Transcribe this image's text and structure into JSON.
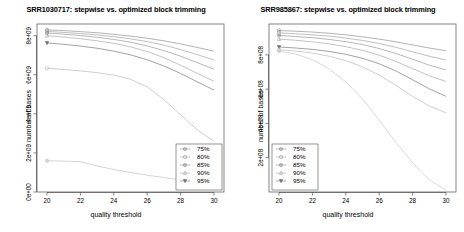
{
  "figure": {
    "width": 464,
    "height": 232,
    "background": "#ffffff",
    "panel_count": 2
  },
  "chart_data": [
    {
      "type": "line",
      "panel_index": 0,
      "title": "SRR1030717: stepwise vs. optimized block trimming",
      "xlabel": "quality threshold",
      "ylabel": "number of bases",
      "xlim": [
        19.4,
        30.6
      ],
      "ylim": [
        0,
        8600000000.0
      ],
      "xticks": [
        20,
        22,
        24,
        26,
        28,
        30
      ],
      "xticklabels": [
        "20",
        "22",
        "24",
        "26",
        "28",
        "30"
      ],
      "yticks": [
        0,
        2000000000,
        4000000000,
        6000000000,
        8000000000
      ],
      "yticklabels": [
        "0e+00",
        "2e+09",
        "4e+09",
        "6e+09",
        "8e+09"
      ],
      "grid": false,
      "legend_position": "bottom-right",
      "legend_entries": [
        "75%",
        "80%",
        "85%",
        "90%",
        "95%"
      ],
      "x": [
        20,
        21,
        22,
        23,
        24,
        25,
        26,
        27,
        28,
        29,
        30
      ],
      "series": [
        {
          "name": "75%",
          "marker": "circle-dot",
          "color": "#8a8a8a",
          "values": [
            8300000000.0,
            8260000000.0,
            8210000000.0,
            8150000000.0,
            8070000000.0,
            7980000000.0,
            7870000000.0,
            7740000000.0,
            7580000000.0,
            7400000000.0,
            7210000000.0
          ]
        },
        {
          "name": "80%",
          "marker": "circle-open",
          "color": "#9c9c9c",
          "values": [
            8220000000.0,
            8170000000.0,
            8110000000.0,
            8040000000.0,
            7950000000.0,
            7840000000.0,
            7700000000.0,
            7520000000.0,
            7290000000.0,
            7030000000.0,
            6760000000.0
          ]
        },
        {
          "name": "85%",
          "marker": "plus-circle",
          "color": "#8f8f8f",
          "values": [
            8140000000.0,
            8080000000.0,
            8010000000.0,
            7920000000.0,
            7810000000.0,
            7670000000.0,
            7480000000.0,
            7240000000.0,
            6950000000.0,
            6620000000.0,
            6290000000.0
          ]
        },
        {
          "name": "90%",
          "marker": "triangle-up",
          "color": "#a2a2a2",
          "values": [
            8000000000.0,
            7930000000.0,
            7850000000.0,
            7740000000.0,
            7610000000.0,
            7430000000.0,
            7190000000.0,
            6880000000.0,
            6490000000.0,
            6070000000.0,
            5670000000.0
          ]
        },
        {
          "name": "95%",
          "marker": "triangle-down",
          "color": "#707070",
          "values": [
            7630000000.0,
            7560000000.0,
            7470000000.0,
            7360000000.0,
            7210000000.0,
            7020000000.0,
            6770000000.0,
            6450000000.0,
            6070000000.0,
            5640000000.0,
            5220000000.0
          ]
        },
        {
          "name": "optimized-upper",
          "marker": "circle-open",
          "color": "#b5b5b5",
          "values": [
            6330000000.0,
            6270000000.0,
            6200000000.0,
            6110000000.0,
            5980000000.0,
            5770000000.0,
            5380000000.0,
            4730000000.0,
            3950000000.0,
            3180000000.0,
            2600000000.0
          ]
        },
        {
          "name": "optimized-lower",
          "marker": "plus-circle",
          "color": "#bcbcbc",
          "values": [
            1600000000.0,
            1580000000.0,
            1550000000.0,
            1330000000.0,
            1150000000.0,
            1000000000.0,
            860000000.0,
            740000000.0,
            620000000.0,
            520000000.0,
            440000000.0
          ]
        }
      ]
    },
    {
      "type": "line",
      "panel_index": 1,
      "title": "SRR985867: stepwise vs. optimized block trimming",
      "xlabel": "quality threshold",
      "ylabel": "number of bases",
      "xlim": [
        19.4,
        30.6
      ],
      "ylim": [
        0,
        980000000.0
      ],
      "xticks": [
        20,
        22,
        24,
        26,
        28,
        30
      ],
      "xticklabels": [
        "20",
        "22",
        "24",
        "26",
        "28",
        "30"
      ],
      "yticks": [
        200000000,
        400000000,
        600000000,
        800000000
      ],
      "yticklabels": [
        "2e+08",
        "4e+08",
        "6e+08",
        "8e+08"
      ],
      "grid": false,
      "legend_position": "bottom-left",
      "legend_entries": [
        "75%",
        "80%",
        "85%",
        "90%",
        "95%"
      ],
      "x": [
        20,
        21,
        22,
        23,
        24,
        25,
        26,
        27,
        28,
        29,
        30
      ],
      "series": [
        {
          "name": "75%",
          "marker": "circle-dot",
          "color": "#8a8a8a",
          "values": [
            942000000.0,
            938000000.0,
            933000000.0,
            926000000.0,
            917000000.0,
            905000000.0,
            892000000.0,
            876000000.0,
            858000000.0,
            840000000.0,
            824000000.0
          ]
        },
        {
          "name": "80%",
          "marker": "circle-open",
          "color": "#9c9c9c",
          "values": [
            928000000.0,
            923000000.0,
            917000000.0,
            909000000.0,
            898000000.0,
            884000000.0,
            866000000.0,
            844000000.0,
            818000000.0,
            792000000.0,
            770000000.0
          ]
        },
        {
          "name": "85%",
          "marker": "plus-circle",
          "color": "#8f8f8f",
          "values": [
            913000000.0,
            907000000.0,
            900000000.0,
            890000000.0,
            877000000.0,
            860000000.0,
            837000000.0,
            808000000.0,
            774000000.0,
            740000000.0,
            712000000.0
          ]
        },
        {
          "name": "90%",
          "marker": "triangle-up",
          "color": "#a2a2a2",
          "values": [
            892000000.0,
            885000000.0,
            876000000.0,
            864000000.0,
            848000000.0,
            826000000.0,
            798000000.0,
            762000000.0,
            720000000.0,
            678000000.0,
            645000000.0
          ]
        },
        {
          "name": "95%",
          "marker": "triangle-down",
          "color": "#707070",
          "values": [
            846000000.0,
            840000000.0,
            832000000.0,
            820000000.0,
            803000000.0,
            780000000.0,
            748000000.0,
            706000000.0,
            655000000.0,
            602000000.0,
            558000000.0
          ]
        },
        {
          "name": "optimized-upper",
          "marker": "circle-open",
          "color": "#b5b5b5",
          "values": [
            830000000.0,
            822000000.0,
            810000000.0,
            792000000.0,
            766000000.0,
            730000000.0,
            682000000.0,
            622000000.0,
            558000000.0,
            502000000.0,
            462000000.0
          ]
        },
        {
          "name": "optimized-lower",
          "marker": "plus-circle",
          "color": "#c2c2c2",
          "values": [
            822000000.0,
            805000000.0,
            772000000.0,
            718000000.0,
            642000000.0,
            542000000.0,
            420000000.0,
            290000000.0,
            170000000.0,
            72000000.0,
            10000000.0
          ]
        }
      ]
    }
  ]
}
